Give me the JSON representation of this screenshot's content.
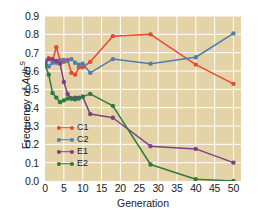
{
  "chart_data": {
    "type": "line",
    "title": "",
    "xlabel": "Generation",
    "ylabel": "Frequency of AdhS",
    "ylabel_parts": {
      "prefix": "Frequency of ",
      "italic": "Adh",
      "superscript": "S"
    },
    "xlim": [
      0,
      52
    ],
    "ylim": [
      0.0,
      0.9
    ],
    "grid": true,
    "grid_color": "#ffffff",
    "plot_background": "#e5d3a8",
    "figure_background": "#ffffff",
    "legend_position": "lower-left-inside",
    "xticks": [
      0,
      5,
      10,
      15,
      20,
      25,
      30,
      35,
      40,
      45,
      50
    ],
    "xticklabels": [
      "0",
      "5",
      "10",
      "15",
      "20",
      "25",
      "30",
      "35",
      "40",
      "45",
      "50"
    ],
    "yticks": [
      0.0,
      0.1,
      0.2,
      0.3,
      0.4,
      0.5,
      0.6,
      0.7,
      0.8,
      0.9
    ],
    "yticklabels": [
      "0.0",
      "0.1",
      "0.2",
      "0.3",
      "0.4",
      "0.5",
      "0.6",
      "0.7",
      "0.8",
      "0.9"
    ],
    "series": [
      {
        "name": "C1",
        "color": "#e8492c",
        "x": [
          0,
          1,
          2,
          3,
          4,
          5,
          6,
          7,
          8,
          9,
          10,
          12,
          18,
          28,
          40,
          50
        ],
        "values": [
          0.64,
          0.67,
          0.66,
          0.73,
          0.66,
          0.65,
          0.66,
          0.59,
          0.58,
          0.62,
          0.62,
          0.65,
          0.79,
          0.8,
          0.635,
          0.53
        ]
      },
      {
        "name": "C2",
        "color": "#4a7fb0",
        "x": [
          0,
          1,
          2,
          3,
          4,
          5,
          6,
          7,
          8,
          9,
          10,
          12,
          18,
          28,
          40,
          50
        ],
        "values": [
          0.655,
          0.625,
          0.645,
          0.645,
          0.655,
          0.66,
          0.655,
          0.665,
          0.645,
          0.635,
          0.64,
          0.59,
          0.665,
          0.64,
          0.675,
          0.805
        ]
      },
      {
        "name": "E1",
        "color": "#7b4088",
        "x": [
          0,
          1,
          2,
          3,
          4,
          5,
          6,
          7,
          8,
          9,
          10,
          12,
          18,
          28,
          40,
          50
        ],
        "values": [
          0.635,
          0.665,
          0.665,
          0.655,
          0.64,
          0.54,
          0.475,
          0.45,
          0.455,
          0.45,
          0.46,
          0.365,
          0.345,
          0.19,
          0.175,
          0.1
        ]
      },
      {
        "name": "E2",
        "color": "#2b7a3e",
        "x": [
          0,
          1,
          2,
          3,
          4,
          5,
          6,
          7,
          8,
          9,
          10,
          12,
          18,
          28,
          40,
          50
        ],
        "values": [
          0.635,
          0.58,
          0.48,
          0.455,
          0.43,
          0.44,
          0.45,
          0.45,
          0.445,
          0.455,
          0.46,
          0.475,
          0.41,
          0.09,
          0.01,
          0.0
        ]
      }
    ],
    "legend": [
      {
        "label": "C1",
        "color": "#e8492c"
      },
      {
        "label": "C2",
        "color": "#4a7fb0"
      },
      {
        "label": "E1",
        "color": "#7b4088"
      },
      {
        "label": "E2",
        "color": "#2b7a3e"
      }
    ]
  }
}
